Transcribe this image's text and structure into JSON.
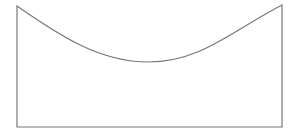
{
  "diagram": {
    "shape": "curved-top-rectangle",
    "stroke_color": "#777777",
    "fill_color": "#ffffff",
    "background": "#ffffff",
    "stroke_width": 1.2,
    "points": {
      "top_left": [
        17,
        6
      ],
      "bottom_left": [
        17,
        127
      ],
      "bottom_right": [
        282,
        127
      ],
      "top_right": [
        282,
        5
      ],
      "curve_min": [
        148,
        62
      ]
    }
  }
}
